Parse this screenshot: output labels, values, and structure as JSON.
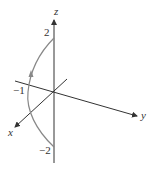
{
  "diagram": {
    "type": "3d-axes-with-curve",
    "axes": {
      "x_label": "x",
      "y_label": "y",
      "z_label": "z"
    },
    "tick_labels": {
      "z_pos": "2",
      "z_neg": "−2",
      "y_neg": "−1"
    },
    "curve": {
      "description": "arc in the x-z plane from (0,0,-2) bulging toward y=-1 side up to (0,0,2) with direction arrow pointing upward",
      "color": "#888888"
    },
    "colors": {
      "axis": "#333333",
      "curve": "#888888",
      "text": "#333333"
    }
  }
}
